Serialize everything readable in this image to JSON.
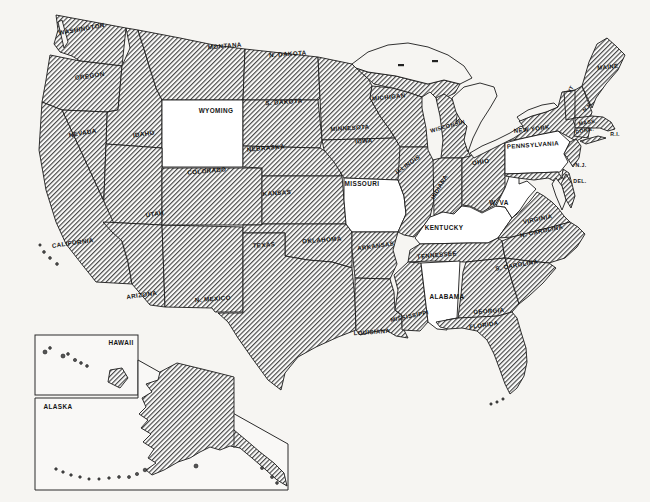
{
  "map": {
    "colors": {
      "ink": "#1b1b1b",
      "paper": "#f6f5f2",
      "hatch_line": "#474747",
      "unshaded_fill": "#ffffff"
    },
    "states": [
      {
        "id": "washington",
        "label": "WASHINGTON",
        "x": 82,
        "y": 31,
        "rot": -10,
        "size": 6.2,
        "hatched": true
      },
      {
        "id": "oregon",
        "label": "OREGON",
        "x": 90,
        "y": 78,
        "rot": -8,
        "size": 6.2,
        "hatched": true
      },
      {
        "id": "california",
        "label": "CALIFORNIA",
        "x": 73,
        "y": 245,
        "rot": -8,
        "size": 6.2,
        "hatched": true
      },
      {
        "id": "nevada",
        "label": "NEVADA",
        "x": 83,
        "y": 135,
        "rot": -10,
        "size": 6.2,
        "hatched": true
      },
      {
        "id": "idaho",
        "label": "IDAHO",
        "x": 144,
        "y": 136,
        "rot": -8,
        "size": 6.2,
        "hatched": true
      },
      {
        "id": "montana",
        "label": "MONTANA",
        "x": 225,
        "y": 48,
        "rot": -5,
        "size": 6.2,
        "hatched": true
      },
      {
        "id": "wyoming",
        "label": "WYOMING",
        "x": 216,
        "y": 113,
        "rot": 0,
        "size": 6.4,
        "hatched": false
      },
      {
        "id": "utah",
        "label": "UTAH",
        "x": 155,
        "y": 216,
        "rot": -8,
        "size": 6.2,
        "hatched": true
      },
      {
        "id": "arizona",
        "label": "ARIZONA",
        "x": 142,
        "y": 297,
        "rot": -8,
        "size": 6.2,
        "hatched": true
      },
      {
        "id": "new-mexico",
        "label": "N. MEXICO",
        "x": 213,
        "y": 301,
        "rot": -4,
        "size": 6.2,
        "hatched": true
      },
      {
        "id": "colorado",
        "label": "COLORADO",
        "x": 207,
        "y": 173,
        "rot": -5,
        "size": 6.2,
        "hatched": true
      },
      {
        "id": "north-dakota",
        "label": "N. DAKOTA",
        "x": 288,
        "y": 56,
        "rot": -4,
        "size": 6.2,
        "hatched": true
      },
      {
        "id": "south-dakota",
        "label": "S. DAKOTA",
        "x": 284,
        "y": 104,
        "rot": -4,
        "size": 6.2,
        "hatched": true
      },
      {
        "id": "nebraska",
        "label": "NEBRASKA",
        "x": 266,
        "y": 150,
        "rot": -5,
        "size": 6.2,
        "hatched": true
      },
      {
        "id": "kansas",
        "label": "KANSAS",
        "x": 277,
        "y": 195,
        "rot": -4,
        "size": 6.2,
        "hatched": true
      },
      {
        "id": "oklahoma",
        "label": "OKLAHOMA",
        "x": 322,
        "y": 242,
        "rot": -4,
        "size": 6.2,
        "hatched": true
      },
      {
        "id": "texas",
        "label": "TEXAS",
        "x": 264,
        "y": 247,
        "rot": -4,
        "size": 6.2,
        "hatched": true
      },
      {
        "id": "minnesota",
        "label": "MINNESOTA",
        "x": 350,
        "y": 130,
        "rot": -4,
        "size": 6.0,
        "hatched": true
      },
      {
        "id": "iowa",
        "label": "IOWA",
        "x": 364,
        "y": 143,
        "rot": -4,
        "size": 6.0,
        "hatched": true
      },
      {
        "id": "missouri",
        "label": "MISSOURI",
        "x": 362,
        "y": 186,
        "rot": 0,
        "size": 6.4,
        "hatched": false
      },
      {
        "id": "arkansas",
        "label": "ARKANSAS",
        "x": 376,
        "y": 248,
        "rot": -8,
        "size": 6.0,
        "hatched": true
      },
      {
        "id": "louisiana",
        "label": "LOUISIANA",
        "x": 372,
        "y": 334,
        "rot": -4,
        "size": 6.0,
        "hatched": true
      },
      {
        "id": "mississippi",
        "label": "MISSISSIPPI",
        "x": 410,
        "y": 318,
        "rot": -12,
        "size": 5.8,
        "hatched": true
      },
      {
        "id": "alabama",
        "label": "ALABAMA",
        "x": 447,
        "y": 299,
        "rot": 0,
        "size": 6.4,
        "hatched": false
      },
      {
        "id": "tennessee",
        "label": "TENNESSEE",
        "x": 437,
        "y": 257,
        "rot": -5,
        "size": 6.0,
        "hatched": true
      },
      {
        "id": "kentucky",
        "label": "KENTUCKY",
        "x": 444,
        "y": 230,
        "rot": 0,
        "size": 6.4,
        "hatched": false
      },
      {
        "id": "illinois",
        "label": "ILLINOIS",
        "x": 409,
        "y": 166,
        "rot": -35,
        "size": 6.0,
        "hatched": true
      },
      {
        "id": "michigan",
        "label": "MICHIGAN",
        "x": 389,
        "y": 99,
        "rot": -6,
        "size": 6.0,
        "hatched": true
      },
      {
        "id": "wisconsin",
        "label": "WISCONSIN",
        "x": 448,
        "y": 128,
        "rot": -15,
        "size": 5.6,
        "hatched": true
      },
      {
        "id": "indiana",
        "label": "INDIANA",
        "x": 441,
        "y": 188,
        "rot": -60,
        "size": 5.8,
        "hatched": true
      },
      {
        "id": "ohio",
        "label": "OHIO",
        "x": 481,
        "y": 164,
        "rot": -8,
        "size": 6.2,
        "hatched": true
      },
      {
        "id": "west-virginia",
        "label": "W. VA",
        "x": 499,
        "y": 205,
        "rot": 0,
        "size": 6.4,
        "hatched": false
      },
      {
        "id": "virginia",
        "label": "VIRGINIA",
        "x": 538,
        "y": 221,
        "rot": -12,
        "size": 6.0,
        "hatched": true
      },
      {
        "id": "north-carolina",
        "label": "N. CAROLINA",
        "x": 542,
        "y": 233,
        "rot": -12,
        "size": 6.0,
        "hatched": true
      },
      {
        "id": "south-carolina",
        "label": "S. CAROLINA",
        "x": 517,
        "y": 267,
        "rot": -10,
        "size": 6.0,
        "hatched": true
      },
      {
        "id": "georgia",
        "label": "GEORGIA",
        "x": 489,
        "y": 313,
        "rot": -4,
        "size": 6.0,
        "hatched": true
      },
      {
        "id": "florida",
        "label": "FLORIDA",
        "x": 484,
        "y": 327,
        "rot": -8,
        "size": 6.0,
        "hatched": true
      },
      {
        "id": "pennsylvania",
        "label": "PENNSYLVANIA",
        "x": 533,
        "y": 147,
        "rot": -4,
        "size": 6.2,
        "hatched": false
      },
      {
        "id": "new-york",
        "label": "NEW YORK",
        "x": 532,
        "y": 131,
        "rot": -6,
        "size": 6.0,
        "hatched": true
      },
      {
        "id": "maine",
        "label": "MAINE",
        "x": 608,
        "y": 69,
        "rot": -6,
        "size": 6.0,
        "hatched": true
      },
      {
        "id": "vermont",
        "label": "VT",
        "x": 572,
        "y": 90,
        "rot": -60,
        "size": 5.2,
        "hatched": true
      },
      {
        "id": "new-hampshire",
        "label": "N.H.",
        "x": 589,
        "y": 108,
        "rot": -45,
        "size": 5.2,
        "hatched": true
      },
      {
        "id": "massachusetts",
        "label": "MASS.",
        "x": 588,
        "y": 124,
        "rot": -10,
        "size": 5.2,
        "hatched": true
      },
      {
        "id": "connecticut",
        "label": "CONN.",
        "x": 585,
        "y": 132,
        "rot": -10,
        "size": 5.2,
        "hatched": true
      },
      {
        "id": "rhode-island",
        "label": "R.I.",
        "x": 615,
        "y": 136,
        "rot": 0,
        "size": 5.2,
        "hatched": true
      },
      {
        "id": "new-jersey",
        "label": "N.J.",
        "x": 581,
        "y": 167,
        "rot": 0,
        "size": 5.2,
        "hatched": true
      },
      {
        "id": "delaware",
        "label": "DEL.",
        "x": 580,
        "y": 183,
        "rot": 0,
        "size": 5.2,
        "hatched": true
      },
      {
        "id": "hawaii",
        "label": "HAWAII",
        "x": 121,
        "y": 345,
        "rot": 0,
        "size": 6.4,
        "hatched": true
      },
      {
        "id": "alaska",
        "label": "ALASKA",
        "x": 58,
        "y": 409,
        "rot": 0,
        "size": 6.4,
        "hatched": true
      }
    ],
    "insets": {
      "hawaii": {
        "label": "HAWAII"
      },
      "alaska": {
        "label": "ALASKA"
      }
    },
    "unshaded_states": [
      "WYOMING",
      "MISSOURI",
      "KENTUCKY",
      "W. VA",
      "PENNSYLVANIA",
      "ALABAMA"
    ]
  }
}
